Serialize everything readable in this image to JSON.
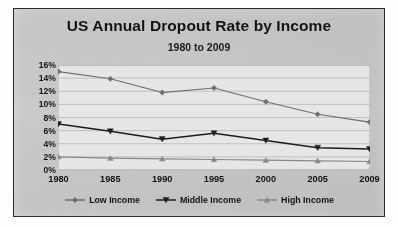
{
  "chart_data": {
    "type": "line",
    "title": "US Annual Dropout Rate by Income",
    "subtitle": "1980 to 2009",
    "xlabel": "",
    "ylabel": "",
    "categories": [
      "1980",
      "1985",
      "1990",
      "1995",
      "2000",
      "2005",
      "2009"
    ],
    "series": [
      {
        "name": "Low Income",
        "marker": "diamond",
        "color": "#6e6e70",
        "values": [
          15.0,
          13.9,
          11.8,
          12.5,
          10.4,
          8.5,
          7.3
        ]
      },
      {
        "name": "Middle Income",
        "marker": "triangle-down",
        "color": "#1d1d20",
        "values": [
          7.0,
          5.9,
          4.7,
          5.6,
          4.5,
          3.4,
          3.2
        ]
      },
      {
        "name": "High Income",
        "marker": "triangle-up",
        "color": "#88888a",
        "values": [
          2.0,
          1.8,
          1.7,
          1.6,
          1.5,
          1.4,
          1.3
        ]
      }
    ],
    "ylim": [
      0,
      16
    ],
    "ytick_step": 2,
    "ytick_labels": [
      "16%",
      "14%",
      "12%",
      "10%",
      "8%",
      "6%",
      "4%",
      "2%",
      "0%"
    ],
    "ytick_values": [
      16,
      14,
      12,
      10,
      8,
      6,
      4,
      2,
      0
    ],
    "grid": true,
    "grid_axis": "y",
    "legend_position": "bottom",
    "plot_background": "#e3e3e1",
    "chart_background": "#c9c9c7",
    "border_color": "#2b2b2b"
  }
}
